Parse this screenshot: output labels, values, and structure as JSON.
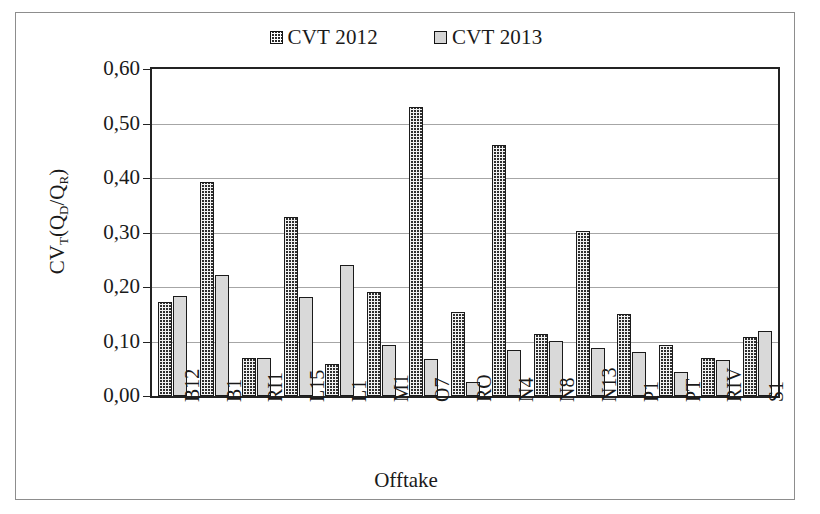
{
  "chart_data": {
    "type": "bar",
    "title": "",
    "xlabel": "Offtake",
    "ylabel": "CVT(QD/QR)",
    "ylabel_parts": {
      "main1": "CV",
      "sub1": "T",
      "main2": "(Q",
      "sub2": "D",
      "main3": "/Q",
      "sub3": "R",
      "main4": ")"
    },
    "categories": [
      "B12",
      "B1",
      "RI1",
      "L15",
      "L1",
      "M1",
      "O7",
      "RO",
      "N4",
      "N8",
      "N13",
      "P1",
      "PT",
      "RIV",
      "S1"
    ],
    "series": [
      {
        "name": "CVT 2012",
        "color": "#2e2e2e",
        "pattern": "dotted-dark",
        "values": [
          0.172,
          0.392,
          0.069,
          0.329,
          0.058,
          0.19,
          0.53,
          0.154,
          0.46,
          0.114,
          0.302,
          0.15,
          0.094,
          0.069,
          0.109
        ]
      },
      {
        "name": "CVT 2013",
        "color": "#d9d9d9",
        "pattern": "solid-light",
        "values": [
          0.183,
          0.222,
          0.07,
          0.182,
          0.241,
          0.093,
          0.068,
          0.025,
          0.085,
          0.101,
          0.088,
          0.08,
          0.044,
          0.067,
          0.12
        ]
      }
    ],
    "ylim": [
      0.0,
      0.6
    ],
    "ytick_values": [
      0.6,
      0.5,
      0.4,
      0.3,
      0.2,
      0.1,
      0.0
    ],
    "ytick_labels": [
      "0,60",
      "0,50",
      "0,40",
      "0,30",
      "0,20",
      "0,10",
      "0,00"
    ],
    "grid": true,
    "legend_position": "top-center",
    "decimal_separator": ","
  },
  "legend": {
    "entries": [
      {
        "label": "CVT 2012",
        "swatch": "dark-dotted"
      },
      {
        "label": "CVT 2013",
        "swatch": "light-gray"
      }
    ]
  }
}
